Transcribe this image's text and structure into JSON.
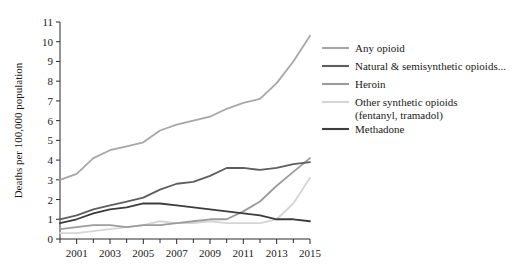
{
  "chart_data": {
    "type": "line",
    "title": "",
    "xlabel": "",
    "ylabel": "Deaths per 100,000 population",
    "xlim": [
      2000,
      2015
    ],
    "ylim": [
      0,
      11
    ],
    "ytick_labels": [
      "0",
      "1",
      "2",
      "3",
      "4",
      "5",
      "6",
      "7",
      "8",
      "9",
      "10",
      "11"
    ],
    "ytick_values": [
      0,
      1,
      2,
      3,
      4,
      5,
      6,
      7,
      8,
      9,
      10,
      11
    ],
    "xtick_labels": [
      "2001",
      "2003",
      "2005",
      "2007",
      "2009",
      "2011",
      "2013",
      "2015"
    ],
    "xtick_values": [
      2001,
      2003,
      2005,
      2007,
      2009,
      2011,
      2013,
      2015
    ],
    "x_minor_ticks": [
      2000,
      2002,
      2004,
      2006,
      2008,
      2010,
      2012,
      2014
    ],
    "grid": false,
    "legend_position": "right",
    "x": [
      2000,
      2001,
      2002,
      2003,
      2004,
      2005,
      2006,
      2007,
      2008,
      2009,
      2010,
      2011,
      2012,
      2013,
      2014,
      2015
    ],
    "series": [
      {
        "name": "Any opioid",
        "color": "#a7a7a7",
        "width": 1.8,
        "values": [
          3.0,
          3.3,
          4.1,
          4.5,
          4.7,
          4.9,
          5.5,
          5.8,
          6.0,
          6.2,
          6.6,
          6.9,
          7.1,
          7.9,
          9.0,
          10.3
        ]
      },
      {
        "name": "Natural & semisynthetic opioids...",
        "color": "#5e5e5e",
        "width": 1.8,
        "values": [
          1.0,
          1.2,
          1.5,
          1.7,
          1.9,
          2.1,
          2.5,
          2.8,
          2.9,
          3.2,
          3.6,
          3.6,
          3.5,
          3.6,
          3.8,
          3.9
        ]
      },
      {
        "name": "Heroin",
        "color": "#9c9c9c",
        "width": 1.8,
        "values": [
          0.5,
          0.6,
          0.7,
          0.7,
          0.6,
          0.7,
          0.7,
          0.8,
          0.9,
          1.0,
          1.0,
          1.4,
          1.9,
          2.7,
          3.4,
          4.1
        ]
      },
      {
        "name": "Other synthetic opioids (fentanyl, tramadol)",
        "color": "#d5d5d5",
        "width": 1.8,
        "values": [
          0.3,
          0.3,
          0.4,
          0.5,
          0.6,
          0.7,
          0.9,
          0.8,
          0.8,
          0.9,
          0.8,
          0.8,
          0.8,
          1.0,
          1.8,
          3.1
        ]
      },
      {
        "name": "Methadone",
        "color": "#3c3c3c",
        "width": 1.8,
        "values": [
          0.8,
          1.0,
          1.3,
          1.5,
          1.6,
          1.8,
          1.8,
          1.7,
          1.6,
          1.5,
          1.4,
          1.3,
          1.2,
          1.0,
          1.0,
          0.9
        ]
      }
    ]
  },
  "legend": {
    "items": [
      {
        "label": "Any opioid",
        "sublabel": "",
        "color": "#a7a7a7"
      },
      {
        "label": "Natural & semisynthetic opioids...",
        "sublabel": "",
        "color": "#5e5e5e"
      },
      {
        "label": "Heroin",
        "sublabel": "",
        "color": "#9c9c9c"
      },
      {
        "label": "Other synthetic opioids",
        "sublabel": "(fentanyl, tramadol)",
        "color": "#d5d5d5"
      },
      {
        "label": "Methadone",
        "sublabel": "",
        "color": "#3c3c3c"
      }
    ]
  }
}
